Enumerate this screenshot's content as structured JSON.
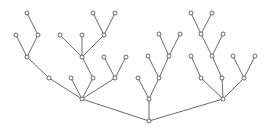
{
  "diagram": {
    "type": "tree",
    "width": 269,
    "height": 132,
    "colors": {
      "stroke": "#444444",
      "node_fill": "#ffffff"
    },
    "node_radius": 2,
    "nodes": [
      {
        "id": "r",
        "x": 149,
        "y": 121
      },
      {
        "id": "a",
        "x": 82,
        "y": 99
      },
      {
        "id": "b",
        "x": 149,
        "y": 99
      },
      {
        "id": "c",
        "x": 223,
        "y": 99
      },
      {
        "id": "a1",
        "x": 49,
        "y": 78
      },
      {
        "id": "a2",
        "x": 71,
        "y": 78
      },
      {
        "id": "a3",
        "x": 93,
        "y": 78
      },
      {
        "id": "a4",
        "x": 115,
        "y": 78
      },
      {
        "id": "a1a",
        "x": 27,
        "y": 57
      },
      {
        "id": "a1a1",
        "x": 16,
        "y": 35
      },
      {
        "id": "a1a2",
        "x": 38,
        "y": 35
      },
      {
        "id": "a1a2a",
        "x": 27,
        "y": 13
      },
      {
        "id": "a3a",
        "x": 82,
        "y": 57
      },
      {
        "id": "a3a1",
        "x": 60,
        "y": 35
      },
      {
        "id": "a3a2",
        "x": 82,
        "y": 35
      },
      {
        "id": "a3a3",
        "x": 104,
        "y": 35
      },
      {
        "id": "a3a3a",
        "x": 93,
        "y": 13
      },
      {
        "id": "a3a3b",
        "x": 115,
        "y": 13
      },
      {
        "id": "a4a",
        "x": 104,
        "y": 57
      },
      {
        "id": "a4b",
        "x": 126,
        "y": 57
      },
      {
        "id": "b1",
        "x": 138,
        "y": 78
      },
      {
        "id": "b2",
        "x": 159,
        "y": 78
      },
      {
        "id": "b2a",
        "x": 148,
        "y": 56
      },
      {
        "id": "b2b",
        "x": 169,
        "y": 56
      },
      {
        "id": "b2b1",
        "x": 159,
        "y": 34
      },
      {
        "id": "b2b2",
        "x": 180,
        "y": 34
      },
      {
        "id": "c1",
        "x": 201,
        "y": 78
      },
      {
        "id": "c2",
        "x": 222,
        "y": 78
      },
      {
        "id": "c3",
        "x": 244,
        "y": 78
      },
      {
        "id": "c1a",
        "x": 191,
        "y": 56
      },
      {
        "id": "c2a",
        "x": 212,
        "y": 56
      },
      {
        "id": "c2a1",
        "x": 201,
        "y": 34
      },
      {
        "id": "c2a2",
        "x": 223,
        "y": 34
      },
      {
        "id": "c2a1a",
        "x": 191,
        "y": 13
      },
      {
        "id": "c2a1b",
        "x": 212,
        "y": 13
      },
      {
        "id": "c3a",
        "x": 233,
        "y": 56
      },
      {
        "id": "c3b",
        "x": 255,
        "y": 56
      }
    ],
    "edges": [
      [
        "r",
        "a"
      ],
      [
        "r",
        "b"
      ],
      [
        "r",
        "c"
      ],
      [
        "a",
        "a1"
      ],
      [
        "a",
        "a2"
      ],
      [
        "a",
        "a3"
      ],
      [
        "a",
        "a4"
      ],
      [
        "a1",
        "a1a"
      ],
      [
        "a1a",
        "a1a1"
      ],
      [
        "a1a",
        "a1a2"
      ],
      [
        "a1a2",
        "a1a2a"
      ],
      [
        "a3",
        "a3a"
      ],
      [
        "a3a",
        "a3a1"
      ],
      [
        "a3a",
        "a3a2"
      ],
      [
        "a3a",
        "a3a3"
      ],
      [
        "a3a3",
        "a3a3a"
      ],
      [
        "a3a3",
        "a3a3b"
      ],
      [
        "a4",
        "a4a"
      ],
      [
        "a4",
        "a4b"
      ],
      [
        "b",
        "b1"
      ],
      [
        "b",
        "b2"
      ],
      [
        "b2",
        "b2a"
      ],
      [
        "b2",
        "b2b"
      ],
      [
        "b2b",
        "b2b1"
      ],
      [
        "b2b",
        "b2b2"
      ],
      [
        "c",
        "c1"
      ],
      [
        "c",
        "c2"
      ],
      [
        "c",
        "c3"
      ],
      [
        "c1",
        "c1a"
      ],
      [
        "c2",
        "c2a"
      ],
      [
        "c2a",
        "c2a1"
      ],
      [
        "c2a",
        "c2a2"
      ],
      [
        "c2a1",
        "c2a1a"
      ],
      [
        "c2a1",
        "c2a1b"
      ],
      [
        "c3",
        "c3a"
      ],
      [
        "c3",
        "c3b"
      ]
    ]
  }
}
